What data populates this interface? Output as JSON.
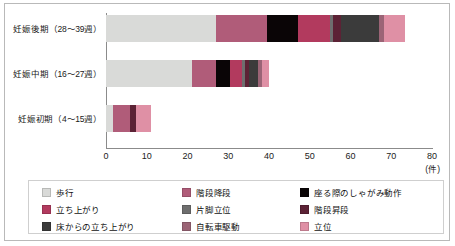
{
  "chart_data": {
    "type": "bar",
    "orientation": "horizontal",
    "stacked": true,
    "title": "",
    "xlabel": "(件)",
    "ylabel": "",
    "xlim": [
      0,
      80
    ],
    "xticks": [
      0,
      10,
      20,
      30,
      40,
      50,
      60,
      70,
      80
    ],
    "grid": false,
    "legend_position": "bottom",
    "categories": [
      "妊娠後期（28〜39週）",
      "妊娠中期（16〜27週）",
      "妊娠初期（4〜15週）"
    ],
    "series": [
      {
        "name": "歩行",
        "color": "#d9dad8",
        "values": [
          27.0,
          21.0,
          1.8
        ]
      },
      {
        "name": "階段降段",
        "color": "#b05c79",
        "values": [
          12.5,
          6.0,
          4.2
        ]
      },
      {
        "name": "座る際のしゃがみ動作",
        "color": "#0a0506",
        "values": [
          7.5,
          3.5,
          0.0
        ]
      },
      {
        "name": "立ち上がり",
        "color": "#b23a5e",
        "values": [
          8.0,
          3.0,
          0.0
        ]
      },
      {
        "name": "片脚立位",
        "color": "#6e6e6e",
        "values": [
          0.8,
          0.7,
          0.0
        ]
      },
      {
        "name": "階段昇段",
        "color": "#5c2235",
        "values": [
          1.8,
          1.0,
          1.4
        ]
      },
      {
        "name": "床からの立ち上がり",
        "color": "#3b3b3b",
        "values": [
          9.5,
          2.0,
          0.0
        ]
      },
      {
        "name": "自転車駆動",
        "color": "#9b6476",
        "values": [
          1.2,
          1.0,
          0.0
        ]
      },
      {
        "name": "立位",
        "color": "#df90a5",
        "values": [
          5.2,
          1.8,
          3.6
        ]
      }
    ],
    "totals": [
      73.5,
      40.0,
      11.0
    ],
    "axis_color": "#8b8b8b",
    "frame_color": "#b9b9b9"
  },
  "legend": {
    "items": [
      {
        "label": "歩行",
        "color": "#d9dad8"
      },
      {
        "label": "階段降段",
        "color": "#b05c79"
      },
      {
        "label": "座る際のしゃがみ動作",
        "color": "#0a0506"
      },
      {
        "label": "立ち上がり",
        "color": "#b23a5e"
      },
      {
        "label": "片脚立位",
        "color": "#6e6e6e"
      },
      {
        "label": "階段昇段",
        "color": "#5c2235"
      },
      {
        "label": "床からの立ち上がり",
        "color": "#3b3b3b"
      },
      {
        "label": "自転車駆動",
        "color": "#9b6476"
      },
      {
        "label": "立位",
        "color": "#df90a5"
      }
    ]
  },
  "axis": {
    "unit_label": "(件)",
    "tick_labels": [
      "0",
      "10",
      "20",
      "30",
      "40",
      "50",
      "60",
      "70",
      "80"
    ]
  }
}
